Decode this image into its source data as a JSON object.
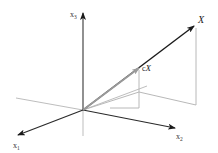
{
  "diagram": {
    "axes": {
      "x1": {
        "label": "x",
        "subscript": "1"
      },
      "x2": {
        "label": "x",
        "subscript": "2"
      },
      "x3": {
        "label": "x",
        "subscript": "3"
      }
    },
    "vectors": {
      "X": {
        "label": "X"
      },
      "cX": {
        "label_c": "c",
        "label_x": "X"
      }
    },
    "colors": {
      "axis": "#2a2a2a",
      "vector_X": "#1a1a1a",
      "vector_cX": "#999999",
      "projection": "#b0b0b0",
      "background": "#ffffff"
    }
  }
}
